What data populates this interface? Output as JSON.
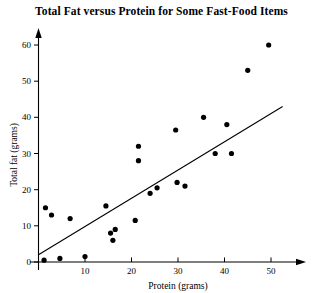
{
  "chart_data": {
    "type": "scatter",
    "title": "Total Fat versus Protein for Some Fast-Food Items",
    "xlabel": "Protein (grams)",
    "ylabel": "Total fat (grams)",
    "xlim": [
      0,
      57
    ],
    "ylim": [
      0,
      64
    ],
    "xticks": [
      10,
      20,
      30,
      40,
      50
    ],
    "yticks": [
      0,
      10,
      20,
      30,
      40,
      50,
      60
    ],
    "xtick_labels": [
      "10",
      "20",
      "30",
      "40",
      "50"
    ],
    "ytick_labels": [
      "0",
      "10",
      "20",
      "30",
      "40",
      "50",
      "60"
    ],
    "grid": false,
    "legend": false,
    "point_color": "#000000",
    "line_color": "#000000",
    "points": [
      {
        "x": 1.2,
        "y": 0.5
      },
      {
        "x": 4.6,
        "y": 1.0
      },
      {
        "x": 10.0,
        "y": 1.5
      },
      {
        "x": 1.5,
        "y": 15.0
      },
      {
        "x": 2.8,
        "y": 13.0
      },
      {
        "x": 6.8,
        "y": 12.0
      },
      {
        "x": 14.5,
        "y": 15.5
      },
      {
        "x": 15.5,
        "y": 8.0
      },
      {
        "x": 16.5,
        "y": 9.0
      },
      {
        "x": 16.0,
        "y": 6.0
      },
      {
        "x": 20.8,
        "y": 11.5
      },
      {
        "x": 21.5,
        "y": 32.0
      },
      {
        "x": 21.5,
        "y": 28.0
      },
      {
        "x": 24.0,
        "y": 19.0
      },
      {
        "x": 25.5,
        "y": 20.5
      },
      {
        "x": 29.5,
        "y": 36.5
      },
      {
        "x": 29.8,
        "y": 22.0
      },
      {
        "x": 31.5,
        "y": 21.0
      },
      {
        "x": 35.5,
        "y": 40.0
      },
      {
        "x": 38.0,
        "y": 30.0
      },
      {
        "x": 40.5,
        "y": 38.0
      },
      {
        "x": 41.5,
        "y": 30.0
      },
      {
        "x": 45.0,
        "y": 53.0
      },
      {
        "x": 49.5,
        "y": 60.0
      }
    ],
    "trend_line": {
      "x_start": 0.0,
      "y_start": 2.0,
      "x_end": 52.5,
      "y_end": 43.0
    }
  }
}
